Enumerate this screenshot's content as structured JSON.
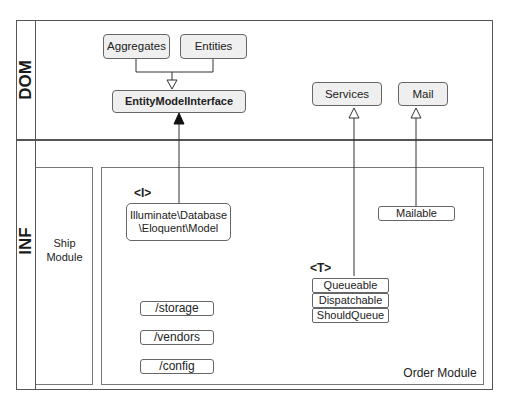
{
  "lanes": {
    "dom_label": "DOM",
    "inf_label": "INF"
  },
  "dom": {
    "aggregates": "Aggregates",
    "entities": "Entities",
    "entity_model_interface": "EntityModelInterface",
    "services": "Services",
    "mail": "Mail"
  },
  "inf": {
    "ship_module": {
      "line1": "Ship",
      "line2": "Module"
    },
    "order_module": {
      "label": "Order Module",
      "interface_tag": "<I>",
      "eloquent_line1": "Illuminate\\Database",
      "eloquent_line2": "\\Eloquent\\Model",
      "mailable": "Mailable",
      "trait_tag": "<T>",
      "traits": [
        "Queueable",
        "Dispatchable",
        "ShouldQueue"
      ],
      "folders": [
        "/storage",
        "/vendors",
        "/config"
      ]
    }
  },
  "colors": {
    "border": "#555555",
    "box_fill": "#efefef",
    "line": "#333333"
  }
}
